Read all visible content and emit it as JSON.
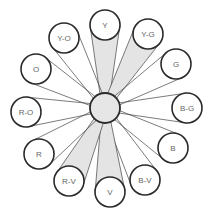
{
  "diagram": {
    "type": "color-wheel-hub-and-spoke",
    "hub": {
      "x": 105,
      "y": 108,
      "r": 15
    },
    "node_radius": 15,
    "highlight_color": "#e4e4e4",
    "nodes": [
      {
        "label": "Y",
        "x": 105,
        "y": 25,
        "highlighted": true
      },
      {
        "label": "Y-G",
        "x": 148,
        "y": 34,
        "highlighted": true
      },
      {
        "label": "G",
        "x": 176,
        "y": 64,
        "highlighted": false
      },
      {
        "label": "B-G",
        "x": 187,
        "y": 108,
        "highlighted": false
      },
      {
        "label": "B",
        "x": 173,
        "y": 148,
        "highlighted": false
      },
      {
        "label": "B-V",
        "x": 145,
        "y": 180,
        "highlighted": false
      },
      {
        "label": "V",
        "x": 110,
        "y": 192,
        "highlighted": true
      },
      {
        "label": "R-V",
        "x": 69,
        "y": 181,
        "highlighted": true
      },
      {
        "label": "R",
        "x": 39,
        "y": 154,
        "highlighted": false
      },
      {
        "label": "R-O",
        "x": 26,
        "y": 112,
        "highlighted": false
      },
      {
        "label": "O",
        "x": 36,
        "y": 69,
        "highlighted": false
      },
      {
        "label": "Y-O",
        "x": 64,
        "y": 38,
        "highlighted": false
      }
    ]
  }
}
